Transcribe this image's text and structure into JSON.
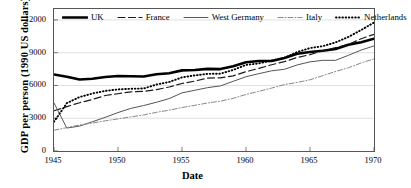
{
  "chart_data": {
    "type": "line",
    "title": "",
    "xlabel": "Date",
    "ylabel": "GDP per person (1990 US dollars)",
    "xlim": [
      1945,
      1970
    ],
    "ylim": [
      0,
      13000
    ],
    "xticks": [
      1945,
      1950,
      1955,
      1960,
      1965,
      1970
    ],
    "yticks": [
      0,
      3000,
      6000,
      9000,
      12000
    ],
    "grid": "horizontal-light",
    "legend_position": "top-inside",
    "x": [
      1945,
      1946,
      1947,
      1948,
      1949,
      1950,
      1951,
      1952,
      1953,
      1954,
      1955,
      1956,
      1957,
      1958,
      1959,
      1960,
      1961,
      1962,
      1963,
      1964,
      1965,
      1966,
      1967,
      1968,
      1969,
      1970
    ],
    "series": [
      {
        "name": "UK",
        "style": "solid-thick",
        "color": "#000000",
        "values": [
          7000,
          6800,
          6550,
          6620,
          6780,
          6860,
          6840,
          6820,
          7020,
          7120,
          7380,
          7420,
          7520,
          7500,
          7760,
          8120,
          8240,
          8240,
          8520,
          8900,
          9060,
          9180,
          9340,
          9720,
          9960,
          10280
        ]
      },
      {
        "name": "France",
        "style": "dashed",
        "color": "#1a1a1a",
        "values": [
          3680,
          4060,
          4420,
          4720,
          5080,
          5240,
          5420,
          5460,
          5620,
          5860,
          6180,
          6400,
          6680,
          6700,
          6880,
          7260,
          7560,
          7900,
          8180,
          8560,
          8820,
          9180,
          9460,
          9760,
          10280,
          10680
        ]
      },
      {
        "name": "West Germany",
        "style": "solid-thin",
        "color": "#555555",
        "values": [
          4400,
          2100,
          2280,
          2680,
          3080,
          3520,
          3900,
          4160,
          4460,
          4800,
          5320,
          5560,
          5800,
          5960,
          6380,
          6800,
          7080,
          7340,
          7480,
          7880,
          8160,
          8300,
          8300,
          8760,
          9240,
          9620
        ]
      },
      {
        "name": "Italy",
        "style": "dash-dot",
        "color": "#888888",
        "values": [
          1900,
          2140,
          2380,
          2560,
          2760,
          2940,
          3120,
          3300,
          3540,
          3740,
          3980,
          4180,
          4400,
          4560,
          4820,
          5180,
          5460,
          5760,
          6080,
          6280,
          6520,
          6900,
          7280,
          7620,
          8060,
          8440
        ]
      },
      {
        "name": "Netherlands",
        "style": "dotted",
        "color": "#000000",
        "values": [
          2680,
          4380,
          4940,
          5260,
          5500,
          5640,
          5700,
          5720,
          6080,
          6320,
          6740,
          6920,
          7060,
          7080,
          7420,
          7880,
          8020,
          8280,
          8520,
          9060,
          9420,
          9600,
          9940,
          10440,
          11080,
          11760
        ]
      }
    ]
  },
  "axis": {
    "x_title": "Date",
    "y_title": "GDP per person (1990 US dollars)",
    "xticks": [
      "1945",
      "1950",
      "1955",
      "1960",
      "1965",
      "1970"
    ],
    "yticks": [
      "12000",
      "9000",
      "6000",
      "3000",
      "0"
    ]
  },
  "legend": {
    "items": [
      {
        "label": "UK",
        "style": "solid-thick"
      },
      {
        "label": "France",
        "style": "dashed"
      },
      {
        "label": "West Germany",
        "style": "solid-thin"
      },
      {
        "label": "Italy",
        "style": "dash-dot"
      },
      {
        "label": "Netherlands",
        "style": "dotted"
      }
    ]
  }
}
